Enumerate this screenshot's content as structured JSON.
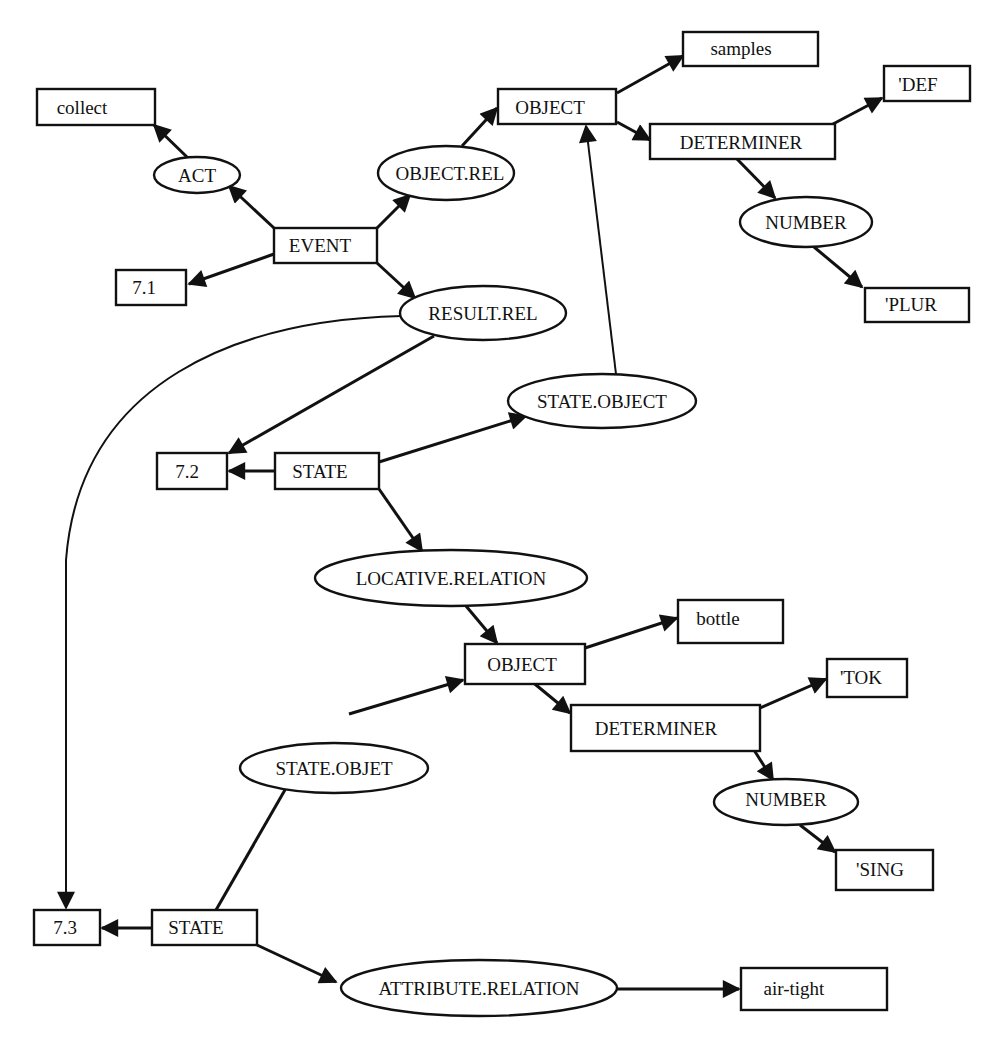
{
  "diagram": {
    "type": "semantic-network",
    "nodes": [
      {
        "id": "collect",
        "label": "collect",
        "shape": "rect"
      },
      {
        "id": "act",
        "label": "ACT",
        "shape": "ellipse"
      },
      {
        "id": "event",
        "label": "EVENT",
        "shape": "rect"
      },
      {
        "id": "n71",
        "label": "7.1",
        "shape": "rect"
      },
      {
        "id": "objrel",
        "label": "OBJECT.REL",
        "shape": "ellipse"
      },
      {
        "id": "object1",
        "label": "OBJECT",
        "shape": "rect"
      },
      {
        "id": "samples",
        "label": "samples",
        "shape": "rect"
      },
      {
        "id": "def",
        "label": "'DEF",
        "shape": "rect"
      },
      {
        "id": "det1",
        "label": "DETERMINER",
        "shape": "rect"
      },
      {
        "id": "num1",
        "label": "NUMBER",
        "shape": "ellipse"
      },
      {
        "id": "plur",
        "label": "'PLUR",
        "shape": "rect"
      },
      {
        "id": "resrel",
        "label": "RESULT.REL",
        "shape": "ellipse"
      },
      {
        "id": "stateobject",
        "label": "STATE.OBJECT",
        "shape": "ellipse"
      },
      {
        "id": "n72",
        "label": "7.2",
        "shape": "rect"
      },
      {
        "id": "state1",
        "label": "STATE",
        "shape": "rect"
      },
      {
        "id": "locrel",
        "label": "LOCATIVE.RELATION",
        "shape": "ellipse"
      },
      {
        "id": "bottle",
        "label": "bottle",
        "shape": "rect"
      },
      {
        "id": "object2",
        "label": "OBJECT",
        "shape": "rect"
      },
      {
        "id": "tok",
        "label": "'TOK",
        "shape": "rect"
      },
      {
        "id": "det2",
        "label": "DETERMINER",
        "shape": "rect"
      },
      {
        "id": "stateobjet",
        "label": "STATE.OBJET",
        "shape": "ellipse"
      },
      {
        "id": "num2",
        "label": "NUMBER",
        "shape": "ellipse"
      },
      {
        "id": "sing",
        "label": "'SING",
        "shape": "rect"
      },
      {
        "id": "n73",
        "label": "7.3",
        "shape": "rect"
      },
      {
        "id": "state2",
        "label": "STATE",
        "shape": "rect"
      },
      {
        "id": "attrrel",
        "label": "ATTRIBUTE.RELATION",
        "shape": "ellipse"
      },
      {
        "id": "airtight",
        "label": "air-tight",
        "shape": "rect"
      }
    ],
    "edges": [
      {
        "from": "event",
        "to": "act"
      },
      {
        "from": "act",
        "to": "collect"
      },
      {
        "from": "event",
        "to": "n71"
      },
      {
        "from": "event",
        "to": "objrel"
      },
      {
        "from": "objrel",
        "to": "object1"
      },
      {
        "from": "object1",
        "to": "samples"
      },
      {
        "from": "object1",
        "to": "det1"
      },
      {
        "from": "det1",
        "to": "def"
      },
      {
        "from": "det1",
        "to": "num1"
      },
      {
        "from": "num1",
        "to": "plur"
      },
      {
        "from": "event",
        "to": "resrel"
      },
      {
        "from": "resrel",
        "to": "n72"
      },
      {
        "from": "resrel",
        "to": "n73"
      },
      {
        "from": "state1",
        "to": "n72"
      },
      {
        "from": "state1",
        "to": "stateobject"
      },
      {
        "from": "stateobject",
        "to": "object1"
      },
      {
        "from": "state1",
        "to": "locrel"
      },
      {
        "from": "locrel",
        "to": "object2"
      },
      {
        "from": "object2",
        "to": "bottle"
      },
      {
        "from": "object2",
        "to": "det2"
      },
      {
        "from": "det2",
        "to": "tok"
      },
      {
        "from": "det2",
        "to": "num2"
      },
      {
        "from": "num2",
        "to": "sing"
      },
      {
        "from": "state2",
        "to": "stateobjet"
      },
      {
        "from": "stateobjet",
        "to": "object2"
      },
      {
        "from": "state2",
        "to": "n73"
      },
      {
        "from": "state2",
        "to": "attrrel"
      },
      {
        "from": "attrrel",
        "to": "airtight"
      }
    ]
  }
}
